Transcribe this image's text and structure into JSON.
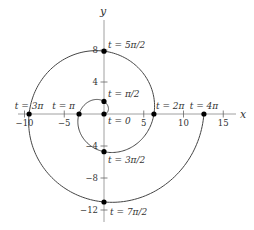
{
  "chart_data": {
    "type": "line",
    "title": "",
    "xlabel": "x",
    "ylabel": "y",
    "xlim": [
      -12,
      17
    ],
    "ylim": [
      -14,
      11
    ],
    "grid": false,
    "legend": null,
    "x_ticks": [
      -10,
      -5,
      5,
      10,
      15
    ],
    "x_tick_labels": [
      "−10",
      "−5",
      "5",
      "10",
      "15"
    ],
    "y_ticks": [
      8,
      4,
      -4,
      -8,
      -12
    ],
    "y_tick_labels": [
      "8",
      "4",
      "−4",
      "−8",
      "−12"
    ],
    "series": [
      {
        "name": "spiral",
        "parametric": {
          "x": "t*cos(t)",
          "y": "t*sin(t)",
          "t_range": [
            0,
            12.566
          ]
        },
        "color": "#444444"
      }
    ],
    "points": [
      {
        "label": "t = 0",
        "t": 0,
        "x": 0,
        "y": 0
      },
      {
        "label": "t = π/2",
        "t": 1.571,
        "x": 0,
        "y": 1.57
      },
      {
        "label": "t = π",
        "t": 3.142,
        "x": -3.14,
        "y": 0
      },
      {
        "label": "t = 3π/2",
        "t": 4.712,
        "x": 0,
        "y": -4.71
      },
      {
        "label": "t = 2π",
        "t": 6.283,
        "x": 6.28,
        "y": 0
      },
      {
        "label": "t = 5π/2",
        "t": 7.854,
        "x": 0,
        "y": 7.85
      },
      {
        "label": "t = 3π",
        "t": 9.425,
        "x": -9.42,
        "y": 0
      },
      {
        "label": "t = 7π/2",
        "t": 10.996,
        "x": 0,
        "y": -11.0
      },
      {
        "label": "t = 4π",
        "t": 12.566,
        "x": 12.57,
        "y": 0
      }
    ]
  },
  "axes": {
    "x_label": "x",
    "y_label": "y"
  }
}
